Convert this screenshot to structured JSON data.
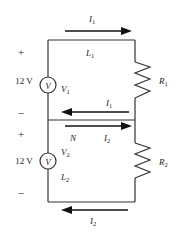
{
  "diagram": {
    "type": "circuit",
    "colors": {
      "wire": "#333333",
      "arrow": "#111111",
      "text": "#222222",
      "background": "#ffffff"
    },
    "top_loop": {
      "source": {
        "voltage": "12 V",
        "symbol": "V",
        "name": "V",
        "subscript": "1",
        "plus": "+",
        "minus": "–"
      },
      "wire_label": {
        "name": "L",
        "subscript": "1"
      },
      "resistor": {
        "name": "R",
        "subscript": "1"
      },
      "current_top": {
        "name": "I",
        "subscript": "1",
        "direction": "right"
      },
      "current_return": {
        "name": "I",
        "subscript": "1",
        "direction": "left"
      }
    },
    "shared_wire": {
      "node_label": "N",
      "current": {
        "name": "I",
        "subscript": "2",
        "direction": "right"
      }
    },
    "bottom_loop": {
      "source": {
        "voltage": "12 V",
        "symbol": "V",
        "name": "V",
        "subscript": "2",
        "plus": "+",
        "minus": "–"
      },
      "wire_label": {
        "name": "L",
        "subscript": "2"
      },
      "resistor": {
        "name": "R",
        "subscript": "2"
      },
      "current_bottom": {
        "name": "I",
        "subscript": "2",
        "direction": "left"
      }
    }
  }
}
